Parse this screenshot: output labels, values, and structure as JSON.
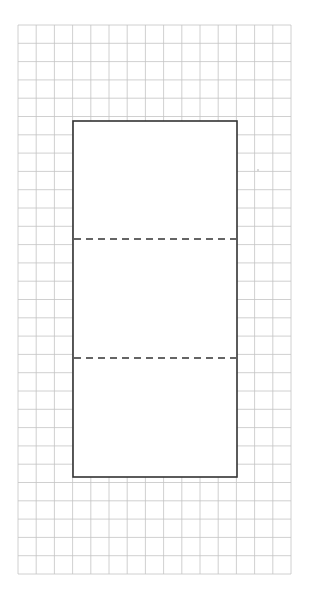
{
  "diagram": {
    "type": "grid-paper-net",
    "background": "#ffffff",
    "grid": {
      "x": 18,
      "y": 25,
      "width": 273,
      "height": 549,
      "columns": 15,
      "rows": 30,
      "line_color": "#c4c4c4",
      "line_width": 0.8
    },
    "rectangle": {
      "x": 73,
      "y": 121,
      "width": 164,
      "height": 356,
      "stroke": "#333333",
      "stroke_width": 1.6,
      "fill": "#ffffff"
    },
    "fold_lines": [
      {
        "y": 239,
        "x1": 74,
        "x2": 236
      },
      {
        "y": 358,
        "x1": 74,
        "x2": 236
      }
    ],
    "fold_style": {
      "stroke": "#333333",
      "stroke_width": 1.4,
      "dash": "7,5"
    },
    "speck": {
      "x": 258,
      "y": 170,
      "r": 0.7,
      "color": "#999999"
    }
  }
}
